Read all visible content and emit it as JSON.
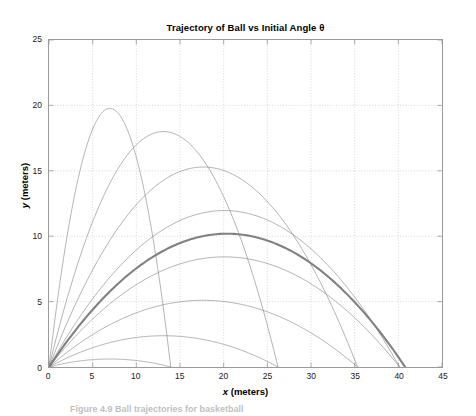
{
  "chart_data": {
    "type": "line",
    "title": "Trajectory of Ball vs Initial Angle θ",
    "xlabel": "x (meters)",
    "xlabel_var": "x",
    "xlabel_unit": "(meters)",
    "ylabel": "y (meters)",
    "ylabel_var": "y",
    "ylabel_unit": "(meters)",
    "xlim": [
      0,
      45
    ],
    "ylim": [
      0,
      25
    ],
    "xticks": [
      0,
      5,
      10,
      15,
      20,
      25,
      30,
      35,
      40,
      45
    ],
    "yticks": [
      0,
      5,
      10,
      15,
      20,
      25
    ],
    "grid": true,
    "grid_style": "dotted",
    "grid_color": "#c8c8c8",
    "axis_color": "#9a9a9a",
    "legend": null,
    "legend_position": "none",
    "line_color": "#808080",
    "highlight_color": "#7a7a7a",
    "initial_speed_m_s": 20,
    "gravity_m_s2": 9.81,
    "series": [
      {
        "name": "θ = 10°",
        "angle_deg": 10,
        "peak_x": 6.97,
        "peak_y": 0.61,
        "range_x": 13.94,
        "highlighted": false
      },
      {
        "name": "θ = 20°",
        "angle_deg": 20,
        "peak_x": 13.11,
        "peak_y": 2.39,
        "range_x": 26.22,
        "highlighted": false
      },
      {
        "name": "θ = 30°",
        "angle_deg": 30,
        "peak_x": 17.66,
        "peak_y": 5.1,
        "range_x": 35.32,
        "highlighted": false
      },
      {
        "name": "θ = 40°",
        "angle_deg": 40,
        "peak_x": 20.07,
        "peak_y": 8.42,
        "range_x": 40.15,
        "highlighted": false
      },
      {
        "name": "θ = 45°",
        "angle_deg": 45,
        "peak_x": 20.39,
        "peak_y": 10.19,
        "range_x": 40.77,
        "highlighted": true
      },
      {
        "name": "θ = 50°",
        "angle_deg": 50,
        "peak_x": 20.07,
        "peak_y": 11.96,
        "range_x": 40.15,
        "highlighted": false
      },
      {
        "name": "θ = 60°",
        "angle_deg": 60,
        "peak_x": 17.66,
        "peak_y": 15.29,
        "range_x": 35.32,
        "highlighted": false
      },
      {
        "name": "θ = 70°",
        "angle_deg": 70,
        "peak_x": 13.11,
        "peak_y": 18.0,
        "range_x": 26.22,
        "highlighted": false
      },
      {
        "name": "θ = 80°",
        "angle_deg": 80,
        "peak_x": 6.97,
        "peak_y": 19.77,
        "range_x": 13.94,
        "highlighted": false
      }
    ]
  },
  "caption": {
    "text": "Figure 4.9   Ball trajectories for basketball"
  }
}
